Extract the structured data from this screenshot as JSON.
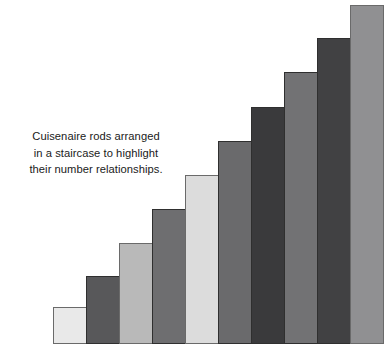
{
  "figure": {
    "background_color": "#ffffff",
    "caption": {
      "lines": [
        "Cuisenaire rods arranged",
        "in a staircase to highlight",
        "their number relationships."
      ],
      "text": "Cuisenaire rods arranged\nin a staircase to highlight\ntheir number relationships.",
      "text_color": "#1a1a1a",
      "align": "center"
    }
  },
  "chart_data": {
    "type": "bar",
    "title": "",
    "subtitle": "",
    "xlabel": "",
    "ylabel": "",
    "categories": [
      "1",
      "2",
      "3",
      "4",
      "5",
      "6",
      "7",
      "8",
      "9",
      "10"
    ],
    "values": [
      1,
      2,
      3,
      4,
      5,
      6,
      7,
      8,
      9,
      10
    ],
    "ylim": [
      0,
      10
    ],
    "xlim": [
      0,
      10
    ],
    "grid": false,
    "legend": false,
    "legend_position": "none",
    "axis_visible": false,
    "tick_labels_visible": false,
    "annotations": [
      "Cuisenaire rods arranged in a staircase to highlight their number relationships."
    ],
    "bar_colors": [
      "#e9e9e9",
      "#58585a",
      "#b9b9b9",
      "#6e6e70",
      "#dcdcdc",
      "#6a6a6c",
      "#3a3a3c",
      "#727274",
      "#414143",
      "#909092"
    ],
    "bar_edge_color": "#6a6a6a",
    "bars": [
      {
        "index": 1,
        "value": 1,
        "color": "#e9e9e9",
        "label": "rod-1",
        "left": 53,
        "top": 307,
        "width": 34,
        "height": 37
      },
      {
        "index": 2,
        "value": 2,
        "color": "#58585a",
        "label": "rod-2",
        "left": 86,
        "top": 276,
        "width": 34,
        "height": 68
      },
      {
        "index": 3,
        "value": 3,
        "color": "#b9b9b9",
        "label": "rod-3",
        "left": 119,
        "top": 243,
        "width": 34,
        "height": 101
      },
      {
        "index": 4,
        "value": 4,
        "color": "#6e6e70",
        "label": "rod-4",
        "left": 152,
        "top": 209,
        "width": 34,
        "height": 135
      },
      {
        "index": 5,
        "value": 5,
        "color": "#dcdcdc",
        "label": "rod-5",
        "left": 185,
        "top": 175,
        "width": 34,
        "height": 169
      },
      {
        "index": 6,
        "value": 6,
        "color": "#6a6a6c",
        "label": "rod-6",
        "left": 218,
        "top": 141,
        "width": 34,
        "height": 203
      },
      {
        "index": 7,
        "value": 7,
        "color": "#3a3a3c",
        "label": "rod-7",
        "left": 251,
        "top": 107,
        "width": 34,
        "height": 237
      },
      {
        "index": 8,
        "value": 8,
        "color": "#727274",
        "label": "rod-8",
        "left": 284,
        "top": 72,
        "width": 34,
        "height": 272
      },
      {
        "index": 9,
        "value": 9,
        "color": "#414143",
        "label": "rod-9",
        "left": 317,
        "top": 38,
        "width": 34,
        "height": 306
      },
      {
        "index": 10,
        "value": 10,
        "color": "#909092",
        "label": "rod-10",
        "left": 350,
        "top": 5,
        "width": 34,
        "height": 339
      }
    ],
    "baseline_y": 344
  }
}
